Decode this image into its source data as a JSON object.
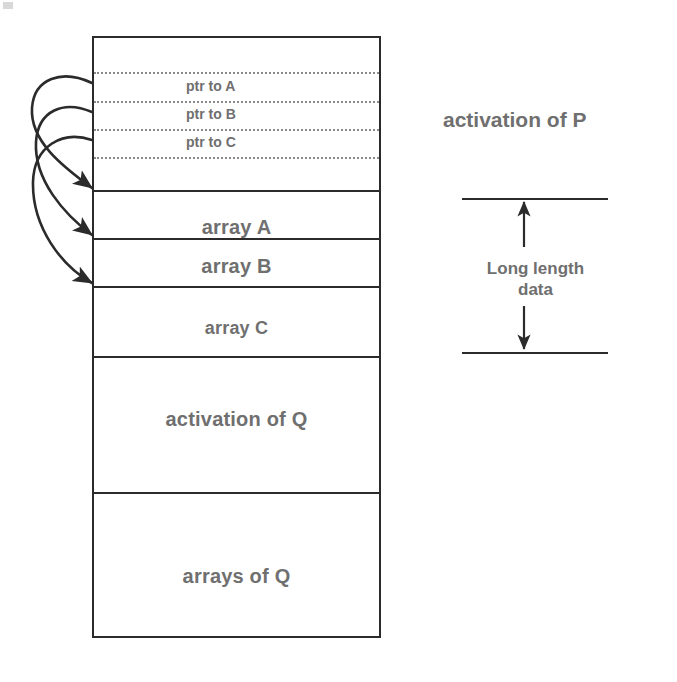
{
  "diagram": {
    "colors": {
      "line": "#2b2b2b",
      "dotted_line": "#8a8a8a",
      "text": "#6f6f6f",
      "background": "#ffffff"
    }
  },
  "stack": {
    "cells": [
      {
        "id": "top-gap",
        "label": ""
      },
      {
        "id": "ptr-a",
        "label": "ptr to A"
      },
      {
        "id": "ptr-b",
        "label": "ptr to B"
      },
      {
        "id": "ptr-c",
        "label": "ptr to C"
      },
      {
        "id": "bottom-gap",
        "label": ""
      },
      {
        "id": "array-a",
        "label": "array A"
      },
      {
        "id": "array-b",
        "label": "array B"
      },
      {
        "id": "array-c",
        "label": "array C"
      },
      {
        "id": "activation-q",
        "label": "activation of Q"
      },
      {
        "id": "arrays-q",
        "label": "arrays of Q"
      }
    ]
  },
  "annotations": {
    "activation_label": "activation of P",
    "dimension_label_line1": "Long length",
    "dimension_label_line2": "data"
  },
  "pointers": [
    {
      "from": "ptr to A",
      "to": "array A"
    },
    {
      "from": "ptr to B",
      "to": "array B"
    },
    {
      "from": "ptr to C",
      "to": "array C"
    }
  ]
}
